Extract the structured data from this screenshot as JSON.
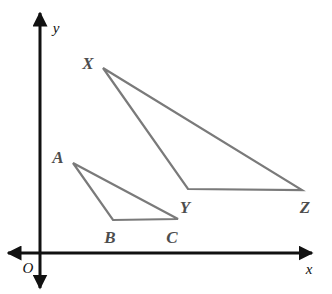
{
  "figure": {
    "background_color": "#ffffff",
    "width": 332,
    "height": 294
  },
  "axes": {
    "color": "#111111",
    "stroke_width": 3,
    "origin_label": "O",
    "origin_label_pos": {
      "x": 28,
      "y": 268
    },
    "x_axis": {
      "label": "x",
      "label_pos": {
        "x": 309,
        "y": 269
      },
      "y": 253,
      "x_start": 8,
      "x_end": 312,
      "arrow_left": true,
      "arrow_right": true
    },
    "y_axis": {
      "label": "y",
      "label_pos": {
        "x": 56,
        "y": 28
      },
      "x": 40,
      "y_start": 13,
      "y_end": 288,
      "arrow_up": true,
      "arrow_down": true
    }
  },
  "triangles": {
    "stroke_color": "#7a7a7a",
    "stroke_width": 2.2,
    "fill": "none",
    "items": [
      {
        "name": "triangle-abc",
        "label": "ABC",
        "vertices": [
          {
            "name": "A",
            "x": 73,
            "y": 163,
            "label": "A",
            "label_x": 58,
            "label_y": 157
          },
          {
            "name": "B",
            "x": 113,
            "y": 220,
            "label": "B",
            "label_x": 110,
            "label_y": 237
          },
          {
            "name": "C",
            "x": 178,
            "y": 219,
            "label": "C",
            "label_x": 172,
            "label_y": 237
          }
        ]
      },
      {
        "name": "triangle-xyz",
        "label": "XYZ",
        "vertices": [
          {
            "name": "X",
            "x": 103,
            "y": 68,
            "label": "X",
            "label_x": 88,
            "label_y": 63
          },
          {
            "name": "Y",
            "x": 188,
            "y": 189,
            "label": "Y",
            "label_x": 185,
            "label_y": 207
          },
          {
            "name": "Z",
            "x": 302,
            "y": 190,
            "label": "Z",
            "label_x": 305,
            "label_y": 207
          }
        ]
      }
    ]
  }
}
